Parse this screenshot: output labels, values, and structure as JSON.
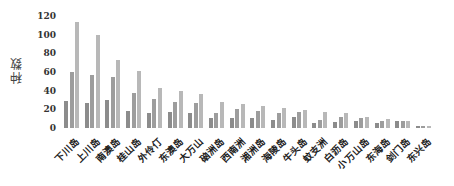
{
  "chart_data": {
    "type": "bar",
    "title": "",
    "xlabel": "",
    "ylabel": "种数",
    "ylim": [
      0,
      120
    ],
    "yticks": [
      0,
      20,
      40,
      60,
      80,
      100,
      120
    ],
    "grid": false,
    "legend": null,
    "categories": [
      "下川岛",
      "上川岛",
      "南澳岛",
      "桂山岛",
      "外伶仃",
      "东澳岛",
      "大万山",
      "硇洲岛",
      "西南洲",
      "湘洲岛",
      "海陵岛",
      "牛头岛",
      "蚊支洲",
      "白沥岛",
      "小万山岛",
      "东海岛",
      "剑门岛",
      "东兴岛"
    ],
    "series": [
      {
        "name": "series1",
        "color": "#8c8c8c",
        "values": [
          29,
          27,
          30,
          18,
          16,
          17,
          16,
          11,
          11,
          11,
          9,
          12,
          5,
          6,
          8,
          5,
          7,
          2
        ]
      },
      {
        "name": "series2",
        "color": "#9d9d9d",
        "values": [
          60,
          57,
          55,
          38,
          31,
          28,
          27,
          16,
          20,
          18,
          16,
          17,
          9,
          12,
          11,
          8,
          7,
          2
        ]
      },
      {
        "name": "series3",
        "color": "#b8b8b8",
        "values": [
          114,
          100,
          73,
          61,
          43,
          40,
          36,
          28,
          26,
          24,
          21,
          19,
          17,
          16,
          12,
          10,
          7,
          2
        ]
      }
    ]
  },
  "layout": {
    "plot_left": 64,
    "plot_zero_y": 128,
    "px_per_unit": 0.933,
    "group_width": 20.7,
    "bar_width": 4,
    "bar_gap": 1.5
  }
}
